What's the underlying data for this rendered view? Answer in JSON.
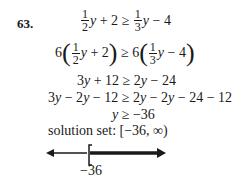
{
  "problem": {
    "number": "63.",
    "steps": [
      {
        "left": {
          "coef_num": "1",
          "coef_den": "2",
          "var": "y",
          "rest": " + 2"
        },
        "op": " ≥ ",
        "right": {
          "coef_num": "1",
          "coef_den": "3",
          "var": "y",
          "rest": " − 4"
        }
      },
      {
        "left": {
          "multiplier": "6",
          "coef_num": "1",
          "coef_den": "2",
          "var": "y",
          "rest": " + 2"
        },
        "op": " ≥ ",
        "right": {
          "multiplier": "6",
          "coef_num": "1",
          "coef_den": "3",
          "var": "y",
          "rest": " − 4"
        }
      },
      {
        "text_parts": [
          "3",
          "y",
          " + 12 ≥ 2",
          "y",
          " − 24"
        ]
      },
      {
        "text_parts": [
          "3",
          "y",
          " − 2",
          "y",
          " − 12 ≥ 2",
          "y",
          " − 2",
          "y",
          " − 24 − 12"
        ]
      },
      {
        "text_parts": [
          "",
          "y",
          " ≥ −36"
        ]
      }
    ],
    "solution_label": "solution set: ",
    "solution_value": "[−36, ∞)"
  },
  "number_line": {
    "endpoint_label": "−36",
    "endpoint_value": -36,
    "bracket": "[",
    "direction": "right",
    "line_color": "#1a1a1a"
  }
}
